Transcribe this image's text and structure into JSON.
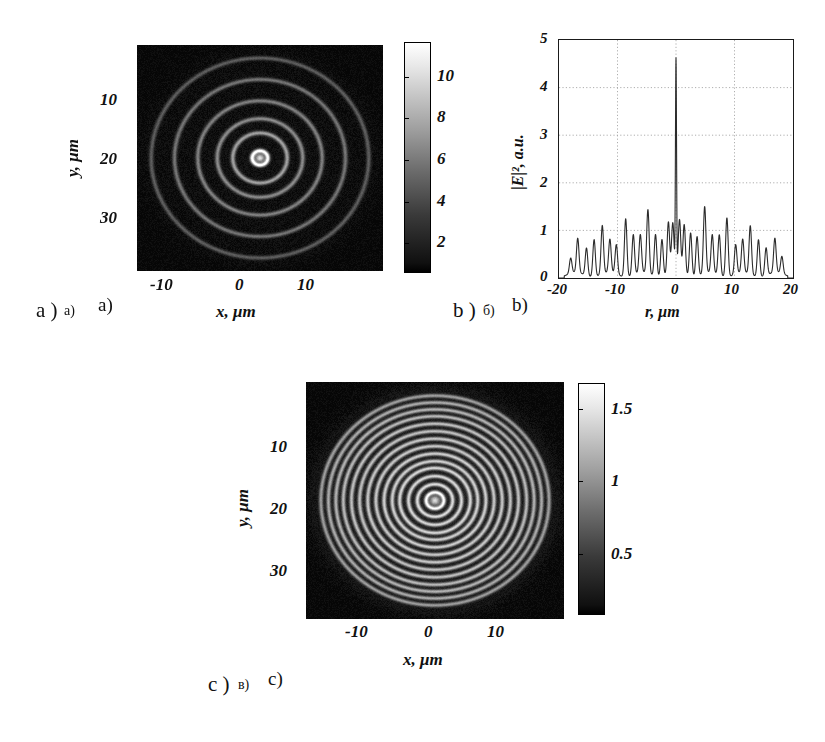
{
  "figure": {
    "title": "",
    "panels": [
      "a",
      "b",
      "c"
    ]
  },
  "panel_a": {
    "caption_latin": "a )",
    "caption_cyrillic": "а)",
    "caption_latin2": "a)",
    "xlabel": "x, μm",
    "ylabel": "y, μm",
    "xticks": [
      "-10",
      "0",
      "10"
    ],
    "yticks": [
      "10",
      "20",
      "30"
    ],
    "colorbar_ticks": [
      "10",
      "8",
      "6",
      "4",
      "2"
    ]
  },
  "panel_b": {
    "caption_latin": "b )",
    "caption_cyrillic": "б)",
    "caption_latin2": "b)",
    "xlabel": "r, μm",
    "ylabel": "|E|², a.u.",
    "xticks": [
      "-20",
      "-10",
      "0",
      "10",
      "20"
    ],
    "yticks": [
      "0",
      "1",
      "2",
      "3",
      "4",
      "5"
    ]
  },
  "panel_c": {
    "caption_latin": "c )",
    "caption_cyrillic": "в)",
    "caption_latin2": "c)",
    "xlabel": "x, μm",
    "ylabel": "y, μm",
    "xticks": [
      "-10",
      "0",
      "10"
    ],
    "yticks": [
      "10",
      "20",
      "30"
    ],
    "colorbar_ticks": [
      "1.5",
      "1",
      "0.5"
    ]
  },
  "chart_data": [
    {
      "id": "panel_a",
      "type": "heatmap",
      "title": "",
      "xlabel": "x, μm",
      "ylabel": "y, μm",
      "xlim": [
        -19,
        19
      ],
      "ylim": [
        0,
        38
      ],
      "xticks": [
        -10,
        0,
        10
      ],
      "yticks": [
        10,
        20,
        30
      ],
      "colormap": "gray",
      "clim": [
        0,
        11
      ],
      "colorbar_ticks": [
        2,
        4,
        6,
        8,
        10
      ],
      "grid": false,
      "legend": "none",
      "description": "Concentric bright rings (Fresnel zone / Bessel-like diffraction pattern) on a dark background; bright central spot at (0,20) with 5 visible outer rings, ring contrast increasing toward center.",
      "rings_radius_um": [
        1.2,
        4.2,
        6.6,
        9.6,
        13.2,
        16.8
      ],
      "ring_amplitude": [
        11.0,
        6.0,
        5.0,
        4.5,
        4.0,
        3.0
      ],
      "background_level": 0.3
    },
    {
      "id": "panel_b",
      "type": "line",
      "title": "",
      "xlabel": "r, μm",
      "ylabel": "|E|², a.u.",
      "xlim": [
        -20,
        20
      ],
      "ylim": [
        0,
        5
      ],
      "xticks": [
        -20,
        -10,
        0,
        10,
        20
      ],
      "yticks": [
        0,
        1,
        2,
        3,
        4,
        5
      ],
      "grid": true,
      "legend": "none",
      "series": [
        {
          "name": "|E|^2",
          "peaks_r": [
            -18.0,
            -16.8,
            -15.3,
            -14.0,
            -12.6,
            -11.3,
            -10.2,
            -8.6,
            -7.3,
            -6.1,
            -4.8,
            -3.5,
            -2.4,
            -1.3,
            -0.55,
            0.0,
            0.6,
            1.4,
            2.5,
            3.6,
            4.9,
            6.2,
            7.4,
            8.7,
            10.2,
            11.4,
            12.7,
            14.1,
            15.4,
            16.9,
            18.1
          ],
          "peaks_value": [
            0.32,
            0.72,
            0.58,
            0.78,
            1.02,
            0.7,
            0.62,
            1.22,
            0.85,
            0.8,
            1.34,
            0.88,
            0.78,
            1.1,
            1.05,
            4.45,
            1.12,
            1.05,
            0.92,
            0.83,
            1.4,
            0.8,
            0.85,
            1.24,
            0.62,
            0.7,
            1.02,
            0.78,
            0.58,
            0.72,
            0.36
          ],
          "baseline": 0.12
        }
      ],
      "description": "Radial intensity cross-section: tall narrow central peak reaching ~4.45 a.u. at r = 0, surrounded by a quasi-periodic train of secondary peaks of amplitude ~0.3-1.4 a.u. over -19 to +19 μm."
    },
    {
      "id": "panel_c",
      "type": "heatmap",
      "title": "",
      "xlabel": "x, μm",
      "ylabel": "y, μm",
      "xlim": [
        -19,
        19
      ],
      "ylim": [
        0,
        38
      ],
      "xticks": [
        -10,
        0,
        10
      ],
      "yticks": [
        10,
        20,
        30
      ],
      "colormap": "gray",
      "clim": [
        0,
        1.75
      ],
      "colorbar_ticks": [
        0.5,
        1,
        1.5
      ],
      "grid": false,
      "legend": "none",
      "description": "Dense concentric ring pattern with ~14 visible rings of nearly uniform brightness filling a disc of radius ~17 μm, central bright spot at (0,20), dark background outside the disc.",
      "rings_radius_um": [
        1.3,
        2.6,
        3.9,
        5.2,
        6.3,
        7.5,
        8.7,
        9.9,
        11.1,
        12.3,
        13.5,
        14.6,
        15.7,
        16.8
      ],
      "ring_amplitude": [
        1.6,
        1.35,
        1.3,
        1.3,
        1.25,
        1.25,
        1.2,
        1.2,
        1.15,
        1.15,
        1.1,
        1.05,
        1.0,
        0.9
      ],
      "background_level": 0.12
    }
  ]
}
